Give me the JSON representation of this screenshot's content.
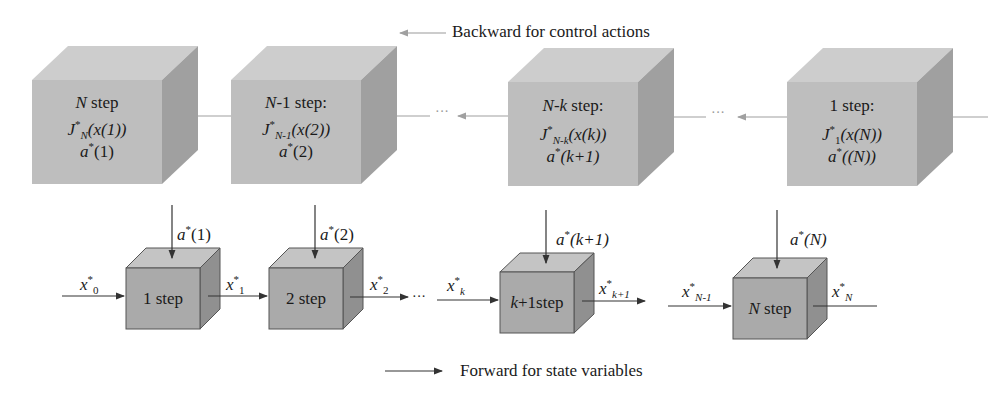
{
  "legend": {
    "backward": "Backward for control actions",
    "forward": "Forward for state variables"
  },
  "top_row": [
    {
      "title_var": "N",
      "title_rest": " step",
      "J_sub": "N",
      "J_arg": "(x(1))",
      "a_arg": "(1)"
    },
    {
      "title_var": "N",
      "title_rest": "-1 step:",
      "J_sub": "N-1",
      "J_arg": "(x(2))",
      "a_arg": "(2)"
    },
    {
      "title_var": "N-k",
      "title_rest": " step:",
      "J_sub": "N-k",
      "J_arg": "(x(k))",
      "a_arg": "(k+1)"
    },
    {
      "title_var": "",
      "title_rest": "1 step:",
      "J_sub": "1",
      "J_arg": "(x(N))",
      "a_arg": "((N))"
    }
  ],
  "bottom_row": [
    {
      "label": "1 step",
      "control": "(1)"
    },
    {
      "label": "2 step",
      "control": "(2)"
    },
    {
      "label": "k+1step",
      "control": "(k+1)"
    },
    {
      "label": "N step",
      "control": "(N)"
    }
  ],
  "states": {
    "x0": "0",
    "x1": "1",
    "x2": "2",
    "xk": "k",
    "xk1": "k+1",
    "xN1": "N-1",
    "xN": "N"
  },
  "symbols": {
    "J": "J",
    "a": "a",
    "x": "x",
    "star": "*",
    "ellipsis": "···"
  },
  "colors": {
    "cube_front": "#bdbdbd",
    "cube_top": "#cfcfcf",
    "cube_side": "#9d9d9d",
    "small_front": "#a9a9a9",
    "small_top": "#c4c4c4",
    "small_side": "#8f8f8f",
    "edge": "#555555",
    "back_arrow": "#9a9a9a"
  }
}
